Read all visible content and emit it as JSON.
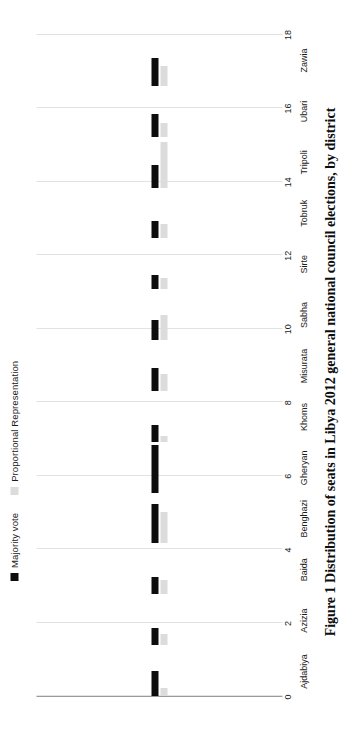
{
  "figure": {
    "caption": "Figure 1 Distribution of seats in Libya 2012 general national council elections, by district"
  },
  "legend": {
    "position": "top",
    "items": [
      {
        "label": "Majority vote",
        "color": "#0d0d0d",
        "icon": "legend-swatch-black"
      },
      {
        "label": "Proportional Representation",
        "color": "#dcdcdc",
        "icon": "legend-swatch-gray"
      }
    ]
  },
  "chart_data": {
    "type": "bar",
    "orientation": "horizontal",
    "title": "",
    "subtitle": "",
    "xlabel": "",
    "ylabel": "",
    "xlim": [
      0,
      18
    ],
    "grid": true,
    "legend_position": "top",
    "ticks": [
      0,
      2,
      4,
      6,
      8,
      10,
      12,
      14,
      16,
      18
    ],
    "categories": [
      "Ajdabiya",
      "Azizia",
      "Baida",
      "Benghazi",
      "Gheryan",
      "Khoms",
      "Misurata",
      "Sabha",
      "Sirte",
      "Tobruk",
      "Tripoli",
      "Ubari",
      "Zawia"
    ],
    "series": [
      {
        "name": "Majority vote",
        "color": "#0d0d0d",
        "values": [
          9,
          6,
          6,
          14,
          17,
          6,
          8,
          7,
          5,
          6,
          8,
          8,
          10
        ]
      },
      {
        "name": "Proportional Representation",
        "color": "#dcdcdc",
        "values": [
          3,
          4,
          5,
          11,
          0,
          2,
          6,
          9,
          4,
          5,
          16,
          5,
          7
        ]
      }
    ]
  }
}
